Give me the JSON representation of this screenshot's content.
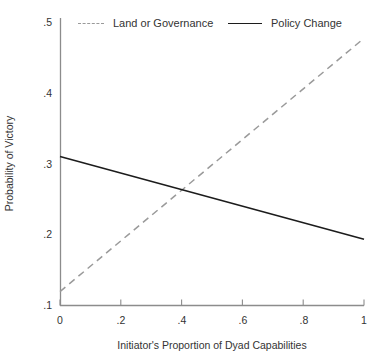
{
  "chart_data": {
    "type": "line",
    "title": "",
    "subtitle": "",
    "xlabel": "Initiator's Proportion of Dyad Capabilities",
    "ylabel": "Probability of Victory",
    "xlim": [
      0,
      1
    ],
    "ylim": [
      0.1,
      0.5
    ],
    "xticks": [
      0,
      0.2,
      0.4,
      0.6,
      0.8,
      1
    ],
    "xtick_labels": [
      "0",
      ".2",
      ".4",
      ".6",
      ".8",
      "1"
    ],
    "yticks": [
      0.1,
      0.2,
      0.3,
      0.4,
      0.5
    ],
    "ytick_labels": [
      ".1",
      ".2",
      ".3",
      ".4",
      ".5"
    ],
    "grid": false,
    "legend_position": "top",
    "series": [
      {
        "name": "Land or Governance",
        "style": "dashed",
        "color": "#9a9a9a",
        "x": [
          0,
          1
        ],
        "values": [
          0.119,
          0.477
        ]
      },
      {
        "name": "Policy Change",
        "style": "solid",
        "color": "#1c1c1c",
        "x": [
          0,
          1
        ],
        "values": [
          0.31,
          0.193
        ]
      }
    ],
    "annotations": []
  },
  "legend": {
    "entries": [
      {
        "label": "Land or Governance",
        "key": "dashed-line-key"
      },
      {
        "label": "Policy Change",
        "key": "solid-line-key"
      }
    ]
  },
  "colors": {
    "background": "#ffffff",
    "axis": "#8c8c8c",
    "text": "#333333",
    "series_land_or_governance": "#9a9a9a",
    "series_policy_change": "#1c1c1c"
  }
}
